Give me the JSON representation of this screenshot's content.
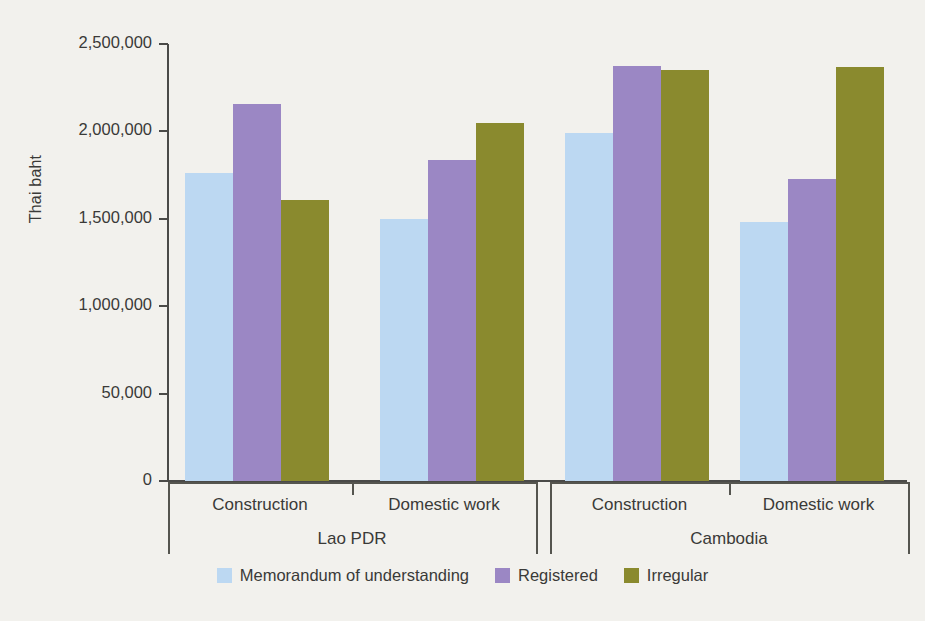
{
  "chart_data": {
    "type": "bar",
    "title": "",
    "subtitle": "",
    "xlabel": "",
    "ylabel": "Thai baht",
    "ylim": [
      0,
      2500000
    ],
    "grid": false,
    "legend_position": "bottom-center",
    "y_tick_labels": [
      "2,500,000",
      "2,000,000",
      "1,500,000",
      "1,000,000",
      "50,000",
      "0"
    ],
    "y_tick_values": [
      2500000,
      2000000,
      1500000,
      1000000,
      500000,
      0
    ],
    "groups": [
      {
        "country": "Lao PDR",
        "categories": [
          "Construction",
          "Domestic work"
        ]
      },
      {
        "country": "Cambodia",
        "categories": [
          "Construction",
          "Domestic work"
        ]
      }
    ],
    "categories": [
      "Lao PDR / Construction",
      "Lao PDR / Domestic work",
      "Cambodia / Construction",
      "Cambodia / Domestic work"
    ],
    "series": [
      {
        "name": "Memorandum of understanding",
        "color": "#bcd8f2",
        "values": [
          1760000,
          1500000,
          1990000,
          1480000
        ]
      },
      {
        "name": "Registered",
        "color": "#9b87c4",
        "values": [
          2155000,
          1835000,
          2375000,
          1725000
        ]
      },
      {
        "name": "Irregular",
        "color": "#8a8a2e",
        "values": [
          1610000,
          2050000,
          2350000,
          2370000
        ]
      }
    ]
  },
  "axis": {
    "y_title": "Thai baht"
  },
  "legend": {
    "items": [
      {
        "label": "Memorandum of understanding",
        "color": "#bcd8f2"
      },
      {
        "label": "Registered",
        "color": "#9b87c4"
      },
      {
        "label": "Irregular",
        "color": "#8a8a2e"
      }
    ]
  },
  "colors": {
    "background": "#f2f1ed",
    "axis": "#4a4a48",
    "text": "#3a3a38",
    "series_mou": "#bcd8f2",
    "series_registered": "#9b87c4",
    "series_irregular": "#8a8a2e"
  }
}
